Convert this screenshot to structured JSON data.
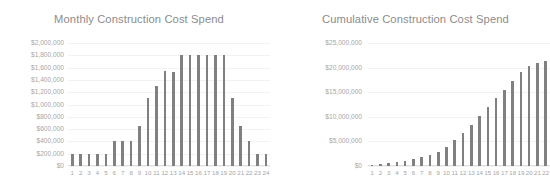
{
  "colors": {
    "bar": "#808080",
    "title_text": "#8c8c8c",
    "axis_text": "#a6a6a6",
    "gridline": "#f2f2f2",
    "background": "#ffffff"
  },
  "charts": [
    {
      "id": "monthly-construction-cost-spend",
      "title": "Monthly Construction Cost Spend"
    },
    {
      "id": "cumulative-construction-cost-spend",
      "title": "Cumulative Construction Cost Spend"
    }
  ],
  "chart_data": [
    {
      "type": "bar",
      "id": "monthly-construction-cost-spend",
      "title": "Monthly Construction Cost Spend",
      "xlabel": "",
      "ylabel": "",
      "grid": true,
      "legend": false,
      "ylim": [
        0,
        2000000
      ],
      "ytick_values": [
        2000000,
        1800000,
        1600000,
        1400000,
        1200000,
        1000000,
        800000,
        600000,
        400000,
        200000,
        0
      ],
      "ytick_labels": [
        "$2,000,000",
        "$1,800,000",
        "$1,600,000",
        "$1,400,000",
        "$1,200,000",
        "$1,000,000",
        "$800,000",
        "$600,000",
        "$400,000",
        "$200,000",
        "$0"
      ],
      "categories": [
        "1",
        "2",
        "3",
        "4",
        "5",
        "6",
        "7",
        "8",
        "9",
        "10",
        "11",
        "12",
        "13",
        "14",
        "15",
        "16",
        "17",
        "18",
        "19",
        "20",
        "21",
        "22",
        "23",
        "24"
      ],
      "values": [
        200000,
        200000,
        200000,
        200000,
        200000,
        400000,
        400000,
        400000,
        650000,
        1100000,
        1300000,
        1550000,
        1530000,
        1800000,
        1800000,
        1800000,
        1800000,
        1800000,
        1800000,
        1100000,
        650000,
        400000,
        200000,
        200000
      ]
    },
    {
      "type": "bar",
      "id": "cumulative-construction-cost-spend",
      "title": "Cumulative Construction Cost Spend",
      "xlabel": "",
      "ylabel": "",
      "grid": true,
      "legend": false,
      "clipped_right_edge": true,
      "ylim": [
        0,
        25000000
      ],
      "ytick_values": [
        25000000,
        20000000,
        15000000,
        10000000,
        5000000,
        0
      ],
      "ytick_labels": [
        "$25,000,000",
        "$20,000,000",
        "$15,000,000",
        "$10,000,000",
        "$5,000,000",
        "$0"
      ],
      "categories": [
        "1",
        "2",
        "3",
        "4",
        "5",
        "6",
        "7",
        "8",
        "9",
        "10",
        "11",
        "12",
        "13",
        "14",
        "15",
        "16",
        "17",
        "18",
        "19",
        "20",
        "21",
        "22"
      ],
      "values": [
        200000,
        400000,
        600000,
        800000,
        1000000,
        1400000,
        1800000,
        2200000,
        2850000,
        3950000,
        5250000,
        6800000,
        8330000,
        10130000,
        11930000,
        13730000,
        15530000,
        17330000,
        19130000,
        20230000,
        20880000,
        21280000
      ]
    }
  ]
}
